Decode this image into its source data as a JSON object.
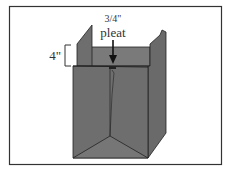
{
  "figure": {
    "label_dimension": "4\"",
    "label_fraction": "3/4\"",
    "label_pleat": "pleat",
    "colors": {
      "panel": "#6e6e6e",
      "panel_light": "#7a7a7a",
      "panel_dark": "#5f5f5f",
      "stroke": "#222222",
      "frame": "#333333"
    }
  }
}
